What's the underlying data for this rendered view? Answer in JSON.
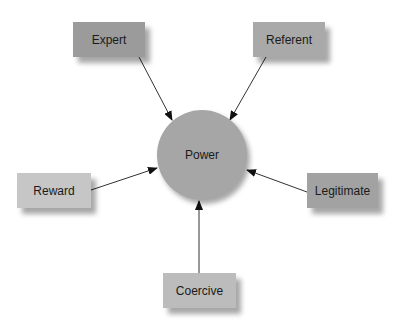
{
  "center": {
    "label": "Power",
    "color": "#a6a6a6"
  },
  "nodes": [
    {
      "id": "expert",
      "label": "Expert",
      "color": "#9b9b9b"
    },
    {
      "id": "referent",
      "label": "Referent",
      "color": "#a9a9a9"
    },
    {
      "id": "reward",
      "label": "Reward",
      "color": "#c6c6c6"
    },
    {
      "id": "legitimate",
      "label": "Legitimate",
      "color": "#a2a2a2"
    },
    {
      "id": "coercive",
      "label": "Coercive",
      "color": "#bcbcbc"
    }
  ],
  "edges": [
    {
      "from": "Expert",
      "to": "Power"
    },
    {
      "from": "Referent",
      "to": "Power"
    },
    {
      "from": "Reward",
      "to": "Power"
    },
    {
      "from": "Legitimate",
      "to": "Power"
    },
    {
      "from": "Coercive",
      "to": "Power"
    }
  ]
}
